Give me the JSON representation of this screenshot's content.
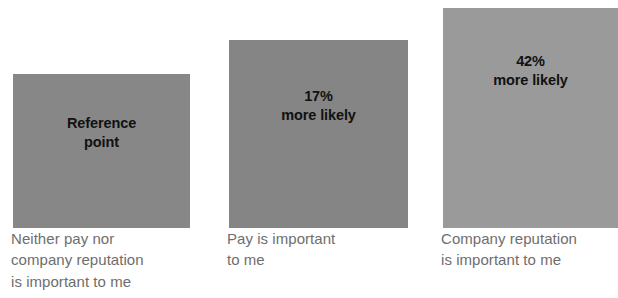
{
  "chart_data": {
    "type": "bar",
    "title": "",
    "subtitle": "",
    "xlabel": "",
    "ylabel": "",
    "grid": false,
    "legend": false,
    "orientation": "vertical",
    "baseline": "bottom-aligned",
    "categories": [
      "Neither pay nor\ncompany reputation\nis important to me",
      "Pay is important\nto me",
      "Company reputation\nis important to me"
    ],
    "values": [
      0,
      17,
      42
    ],
    "value_unit": "% more likely",
    "data_labels": [
      "Reference\npoint",
      "17%\nmore likely",
      "42%\nmore likely"
    ],
    "bar_colors": [
      "#878787",
      "#858585",
      "#9a9a9a"
    ]
  },
  "bars": [
    {
      "id": "bar-1",
      "value_label": "Reference\npoint",
      "category_label": "Neither pay nor\ncompany reputation\nis important to me",
      "color": "#878787",
      "value": 0
    },
    {
      "id": "bar-2",
      "value_label": "17%\nmore likely",
      "category_label": "Pay is important\nto me",
      "color": "#858585",
      "value": 17
    },
    {
      "id": "bar-3",
      "value_label": "42%\nmore likely",
      "category_label": "Company reputation\nis important to me",
      "color": "#9a9a9a",
      "value": 42
    }
  ],
  "colors": {
    "background": "#ffffff",
    "bar_default": "#8a8a8a",
    "value_text": "#111111",
    "category_text": "#6e6e6e"
  }
}
